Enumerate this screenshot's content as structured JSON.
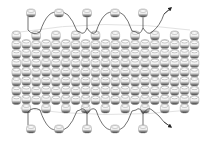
{
  "diagram": {
    "title": "",
    "type": "bead-weave-thread-path",
    "band": {
      "columns": 19,
      "rows_per_column": 8,
      "offset_pattern": "alternating half-bead stagger"
    },
    "top_edge": {
      "picot_beads": 5,
      "thread_arrow": "right"
    },
    "bottom_edge": {
      "picot_beads": 5,
      "thread_arrow": "right"
    },
    "colors": {
      "bead_fill": "#f4f4f4",
      "bead_shadow": "#3a3a3a",
      "bead_mid": "#9a9a9a",
      "thread": "#333333",
      "guide_line": "#e2e2e2",
      "background": "#ffffff"
    }
  }
}
